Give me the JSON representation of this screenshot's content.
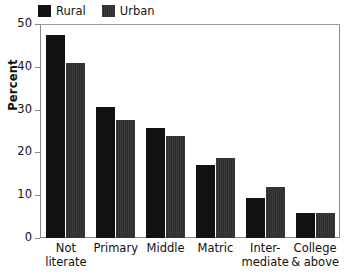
{
  "legend": {
    "entries": [
      {
        "label": "Rural",
        "color": "#111111",
        "swatch_name": "legend-swatch-rural"
      },
      {
        "label": "Urban",
        "color": "#2e2e2e",
        "swatch_name": "legend-swatch-urban"
      }
    ]
  },
  "axes": {
    "ylabel": "Percent",
    "yticks": [
      "0",
      "10",
      "20",
      "30",
      "40",
      "50"
    ]
  },
  "xlabels": [
    "Not\nliterate",
    "Primary",
    "Middle",
    "Matric",
    "Inter-\nmediate",
    "College\n& above"
  ],
  "chart_data": {
    "type": "bar",
    "title": "",
    "xlabel": "",
    "ylabel": "Percent",
    "ylim": [
      0,
      50
    ],
    "yticks": [
      0,
      10,
      20,
      30,
      40,
      50
    ],
    "grid": false,
    "legend_position": "top-left",
    "categories": [
      "Not literate",
      "Primary",
      "Middle",
      "Matric",
      "Intermediate",
      "College & above"
    ],
    "series": [
      {
        "name": "Rural",
        "color": "#111111",
        "values": [
          47.5,
          30.6,
          25.8,
          17.1,
          9.4,
          5.8
        ]
      },
      {
        "name": "Urban",
        "color": "#2e2e2e",
        "values": [
          41.0,
          27.6,
          23.9,
          18.6,
          12.0,
          5.8
        ]
      }
    ]
  }
}
